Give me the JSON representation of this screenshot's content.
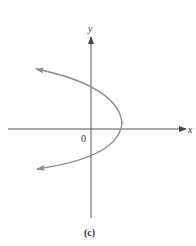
{
  "figure": {
    "caption": "(c)",
    "x_axis_label": "x",
    "y_axis_label": "y",
    "origin_label": "0",
    "colors": {
      "axis": "#555555",
      "curve": "#8a8a8a",
      "text": "#333333",
      "background": "#ffffff"
    },
    "curve": {
      "type": "parabola",
      "orientation": "opens-left",
      "vertex_px": [
        122,
        123
      ],
      "y_axis_crossings_px": [
        86,
        152
      ],
      "arrow_ends_px": [
        [
          35,
          69
        ],
        [
          36,
          169
        ]
      ]
    }
  }
}
